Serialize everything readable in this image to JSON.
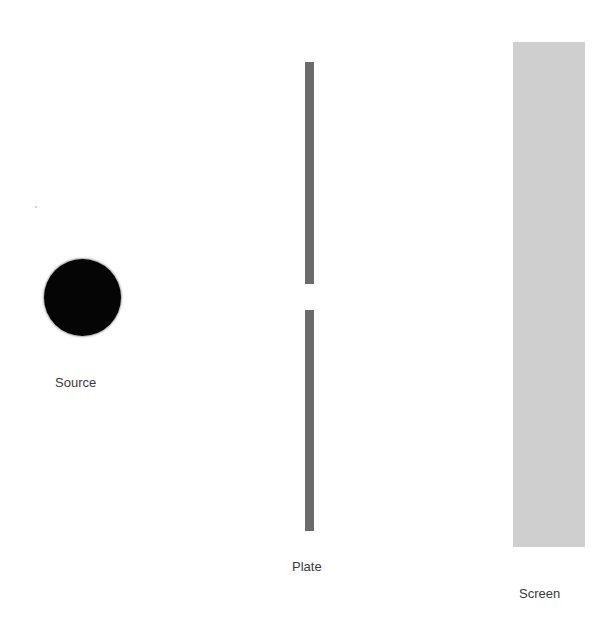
{
  "diagram": {
    "type": "single-slit experiment setup",
    "elements": {
      "source": {
        "label": "Source",
        "shape": "filled-circle",
        "color": "#050505"
      },
      "plate": {
        "label": "Plate",
        "shape": "vertical-bar-with-slit",
        "color": "#6b6b6b"
      },
      "screen": {
        "label": "Screen",
        "shape": "tall-rectangle",
        "color": "#cfcfcf"
      }
    }
  }
}
